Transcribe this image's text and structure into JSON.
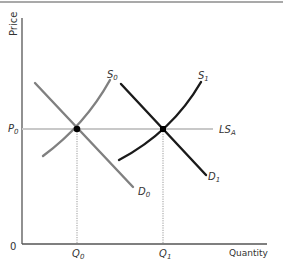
{
  "diagram": {
    "type": "supply-demand",
    "axes": {
      "y_label": "Price",
      "x_label": "Quantity",
      "origin_label": "0"
    },
    "price_levels": [
      {
        "label": "P",
        "sub": "0"
      }
    ],
    "quantity_levels": [
      {
        "label": "Q",
        "sub": "0"
      },
      {
        "label": "Q",
        "sub": "1"
      }
    ],
    "curves": [
      {
        "id": "D0",
        "label": "D",
        "sub": "0",
        "kind": "demand",
        "color": "#808080"
      },
      {
        "id": "S0",
        "label": "S",
        "sub": "0",
        "kind": "supply",
        "color": "#808080"
      },
      {
        "id": "D1",
        "label": "D",
        "sub": "1",
        "kind": "demand",
        "color": "#1a1a1a"
      },
      {
        "id": "S1",
        "label": "S",
        "sub": "1",
        "kind": "supply",
        "color": "#1a1a1a"
      },
      {
        "id": "LSA",
        "label": "LS",
        "sub": "A",
        "kind": "long-run-supply",
        "color": "#c8c8c8"
      }
    ],
    "equilibria": [
      {
        "id": "E0",
        "at": "P0,Q0"
      },
      {
        "id": "E1",
        "at": "P0,Q1"
      }
    ]
  }
}
